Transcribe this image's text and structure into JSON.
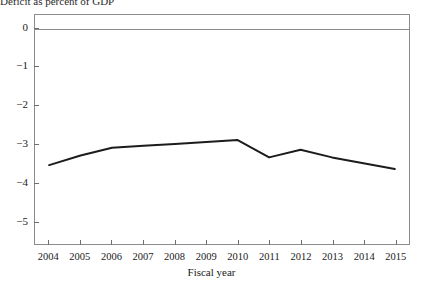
{
  "chart_data": {
    "type": "line",
    "title": "Deficit as percent of GDP",
    "xlabel": "Fiscal year",
    "ylabel": "",
    "categories": [
      "2004",
      "2005",
      "2006",
      "2007",
      "2008",
      "2009",
      "2010",
      "2011",
      "2012",
      "2013",
      "2014",
      "2015"
    ],
    "x": [
      2004,
      2005,
      2006,
      2007,
      2008,
      2009,
      2010,
      2011,
      2012,
      2013,
      2014,
      2015
    ],
    "values": [
      -3.55,
      -3.3,
      -3.1,
      -3.05,
      -3.0,
      -2.95,
      -2.9,
      -3.35,
      -3.15,
      -3.35,
      -3.5,
      -3.65
    ],
    "series": [
      {
        "name": "Deficit as percent of GDP",
        "values": [
          -3.55,
          -3.3,
          -3.1,
          -3.05,
          -3.0,
          -2.95,
          -2.9,
          -3.35,
          -3.15,
          -3.35,
          -3.5,
          -3.65
        ]
      }
    ],
    "ylim": [
      -5.6,
      0.35
    ],
    "xlim": [
      2003.55,
      2015.45
    ],
    "yticks": [
      0,
      -1,
      -2,
      -3,
      -4,
      -5
    ],
    "ytick_labels": [
      "0",
      "−1",
      "−2",
      "−3",
      "−4",
      "−5"
    ],
    "xticks": [
      2004,
      2005,
      2006,
      2007,
      2008,
      2009,
      2010,
      2011,
      2012,
      2013,
      2014,
      2015
    ],
    "grid": false,
    "legend": "none",
    "zero_line": true,
    "line_color": "#1c1c1c",
    "axis_color": "#8c8c8c",
    "background_color": "#ffffff"
  }
}
